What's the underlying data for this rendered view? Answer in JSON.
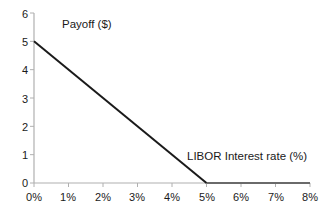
{
  "chart_data": {
    "type": "line",
    "title": "",
    "xlabel": "LIBOR Interest rate (%)",
    "ylabel": "Payoff ($)",
    "xlim": [
      0,
      8
    ],
    "ylim": [
      0,
      6
    ],
    "grid": false,
    "legend": "none",
    "x_tick_labels": [
      "0%",
      "1%",
      "2%",
      "3%",
      "4%",
      "5%",
      "6%",
      "7%",
      "8%"
    ],
    "x_tick_values": [
      0,
      1,
      2,
      3,
      4,
      5,
      6,
      7,
      8
    ],
    "y_tick_labels": [
      "0",
      "1",
      "2",
      "3",
      "4",
      "5",
      "6"
    ],
    "y_tick_values": [
      0,
      1,
      2,
      3,
      4,
      5,
      6
    ],
    "series": [
      {
        "name": "Payoff",
        "x": [
          0,
          5,
          8
        ],
        "values": [
          5,
          0,
          0
        ],
        "color": "#1a1a1a"
      }
    ],
    "annotations": [
      {
        "text": "Payoff ($)",
        "x": 1.6,
        "y": 5.75
      },
      {
        "text": "LIBOR Interest rate (%)",
        "x": 4.9,
        "y": 1.05
      }
    ],
    "axis_color": "#b0b0b0",
    "line_color": "#1a1a1a",
    "flat_segment_color": "#6a6a6a"
  }
}
